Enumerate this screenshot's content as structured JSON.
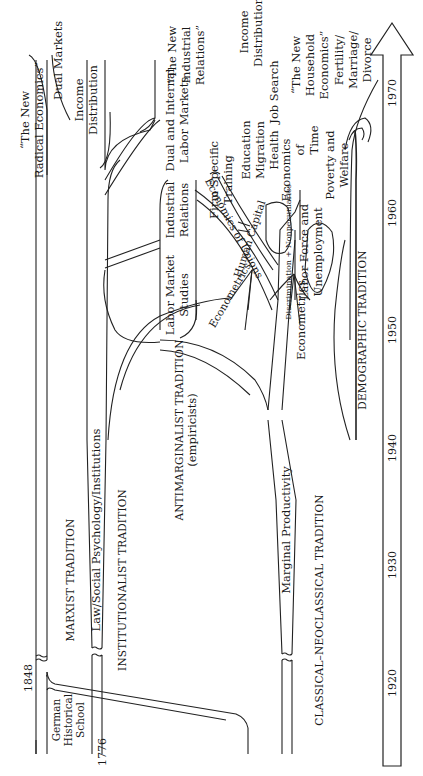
{
  "orientation": "rotated -90deg (time axis runs bottom-to-top along right edge)",
  "timeline": {
    "years": [
      "1920",
      "1930",
      "1940",
      "1950",
      "1960",
      "1970"
    ],
    "start_marks": [
      "1776",
      "1848"
    ]
  },
  "traditions": {
    "marxist": "MARXIST TRADITION",
    "institutionalist": "INSTITUTIONALIST TRADITION",
    "antimarginalist": "ANTIMARGINALIST TRADITION",
    "antimarginalist_sub": "(empiricists)",
    "classical": "CLASSICAL–NEOCLASSICAL TRADITION",
    "demographic": "DEMOGRAPHIC TRADITION"
  },
  "branches": {
    "german_1": "German",
    "german_2": "Historical",
    "german_3": "School",
    "law": "Law/Social Psychology/Institutions",
    "marginal": "Marginal Productivity",
    "labor_market_1": "Labor Market",
    "labor_market_2": "Studies",
    "industrial_1": "Industrial",
    "industrial_2": "Relations",
    "dual_internal_1": "Dual and Internal",
    "dual_internal_2": "Labor Markets",
    "econometrics_a": "Econometrics",
    "econometrics_b": "Econometrics",
    "unions": "Economics of Unions",
    "human_capital": "Human Capital",
    "discrimination": "Discrimination + Nonpecuniaries",
    "labor_force_1": "Labor Force and",
    "labor_force_2": "Unemployment",
    "poverty_1": "Poverty and",
    "poverty_2": "Welfare",
    "firm_1": "Firm Specific",
    "firm_2": "Training",
    "edu_1": "Education",
    "edu_2": "Migration",
    "edu_3": "Health",
    "job_search": "Job Search",
    "eot_1": "Economics",
    "eot_2": "of",
    "eot_3": "Time",
    "income_r_1": "Income",
    "income_r_2": "Distribution",
    "household_1": "“The New",
    "household_2": "Household",
    "household_3": "Economics”",
    "fertility_1": "Fertility/",
    "fertility_2": "Marriage/",
    "fertility_3": "Divorce",
    "dual_markets": "Dual Markets",
    "income_l_1": "Income",
    "income_l_2": "Distribution",
    "radical_1": "“The New",
    "radical_2": "Radical Economics”",
    "new_ir_1": "“The New",
    "new_ir_2": "Industrial",
    "new_ir_3": "Relations”"
  }
}
